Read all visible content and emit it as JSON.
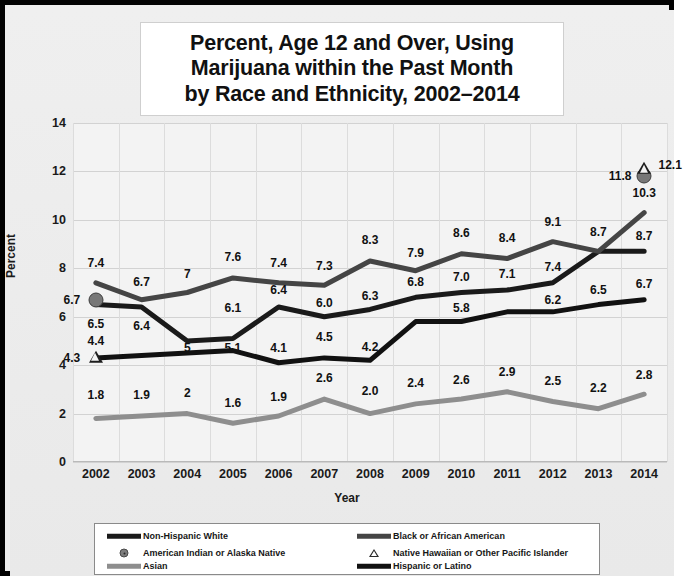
{
  "chart_data": {
    "type": "line",
    "title_lines": [
      "Percent, Age 12 and Over, Using",
      "Marijuana within the Past Month",
      "by Race and Ethnicity, 2002–2014"
    ],
    "xlabel": "Year",
    "ylabel": "Percent",
    "ylim": [
      0,
      14
    ],
    "yticks": [
      0,
      2,
      4,
      6,
      8,
      10,
      12,
      14
    ],
    "ytick_labels": [
      "0",
      "2",
      "4",
      "6",
      "8",
      "10",
      "12",
      "14"
    ],
    "grid": true,
    "legend_position": "bottom",
    "categories": [
      2002,
      2003,
      2004,
      2005,
      2006,
      2007,
      2008,
      2009,
      2010,
      2011,
      2012,
      2013,
      2014
    ],
    "xtick_labels": [
      "2002",
      "2003",
      "2004",
      "2005",
      "2006",
      "2007",
      "2008",
      "2009",
      "2010",
      "2011",
      "2012",
      "2013",
      "2014"
    ],
    "series": [
      {
        "name": "Non-Hispanic White",
        "color": "#1a1a1a",
        "style": "line-thick",
        "values": [
          6.5,
          6.4,
          5.0,
          5.1,
          6.4,
          6.0,
          6.3,
          6.8,
          7.0,
          7.1,
          7.4,
          8.7,
          8.7
        ],
        "labels": [
          "6.5",
          "6.4",
          "5",
          "5.1",
          "6.4",
          "6.0",
          "6.3",
          "6.8",
          "7.0",
          "7.1",
          "7.4",
          "8.7",
          "8.7"
        ]
      },
      {
        "name": "Black or African American",
        "color": "#454545",
        "style": "line-thick",
        "values": [
          7.4,
          6.7,
          7.0,
          7.6,
          7.4,
          7.3,
          8.3,
          7.9,
          8.6,
          8.4,
          9.1,
          8.7,
          10.3
        ],
        "labels": [
          "7.4",
          "6.7",
          "7",
          "7.6",
          "7.4",
          "7.3",
          "8.3",
          "7.9",
          "8.6",
          "8.4",
          "9.1",
          "8.7",
          "10.3"
        ]
      },
      {
        "name": "American Indian or Alaska Native",
        "color": "#777777",
        "style": "marker-circle",
        "values": [
          6.7,
          null,
          null,
          null,
          null,
          null,
          null,
          null,
          null,
          null,
          null,
          null,
          11.8
        ],
        "labels": [
          "6.7",
          "",
          "",
          "",
          "",
          "",
          "",
          "",
          "",
          "",
          "",
          "",
          "11.8"
        ]
      },
      {
        "name": "Native Hawaiian or Other Pacific Islander",
        "color": "#1d1d1d",
        "style": "marker-triangle",
        "values": [
          4.3,
          null,
          null,
          null,
          null,
          null,
          null,
          null,
          null,
          null,
          null,
          null,
          12.1
        ],
        "labels": [
          "4.3",
          "",
          "",
          "",
          "",
          "",
          "",
          "",
          "",
          "",
          "",
          "",
          "12.1"
        ]
      },
      {
        "name": "Asian",
        "color": "#8e8e8e",
        "style": "line-thick",
        "values": [
          1.8,
          1.9,
          2.0,
          1.6,
          1.9,
          2.6,
          2.0,
          2.4,
          2.6,
          2.9,
          2.5,
          2.2,
          2.8
        ],
        "labels": [
          "1.8",
          "1.9",
          "2",
          "1.6",
          "1.9",
          "2.6",
          "2.0",
          "2.4",
          "2.6",
          "2.9",
          "2.5",
          "2.2",
          "2.8"
        ]
      },
      {
        "name": "Hispanic or Latino",
        "color": "#111111",
        "style": "line-thick",
        "values": [
          4.3,
          4.4,
          4.5,
          4.6,
          4.1,
          4.3,
          4.2,
          5.8,
          5.8,
          6.2,
          6.2,
          6.5,
          6.7
        ],
        "labels": [
          "",
          "4.4",
          "",
          "",
          "4.1",
          "4.5",
          "4.2",
          "5.8",
          "",
          "6.2",
          "",
          "6.5",
          "6.7"
        ]
      }
    ],
    "annotations": [
      {
        "text": "7.4",
        "x": 2002,
        "y": 8.2,
        "series": "Black or African American"
      },
      {
        "text": "6.7",
        "x": 2003,
        "y": 7.45,
        "series": "Black or African American"
      },
      {
        "text": "7",
        "x": 2004,
        "y": 7.75,
        "series": "Black or African American"
      },
      {
        "text": "7.6",
        "x": 2005,
        "y": 8.45,
        "series": "Black or African American"
      },
      {
        "text": "7.4",
        "x": 2006,
        "y": 8.2,
        "series": "Black or African American"
      },
      {
        "text": "7.3",
        "x": 2007,
        "y": 8.1,
        "series": "Black or African American"
      },
      {
        "text": "8.3",
        "x": 2008,
        "y": 9.15,
        "series": "Black or African American"
      },
      {
        "text": "7.9",
        "x": 2009,
        "y": 8.65,
        "series": "Black or African American"
      },
      {
        "text": "8.6",
        "x": 2010,
        "y": 9.45,
        "series": "Black or African American"
      },
      {
        "text": "8.4",
        "x": 2011,
        "y": 9.25,
        "series": "Black or African American"
      },
      {
        "text": "9.1",
        "x": 2012,
        "y": 9.9,
        "series": "Black or African American"
      },
      {
        "text": "8.7",
        "x": 2013,
        "y": 9.5,
        "series": "Black or African American"
      },
      {
        "text": "10.3",
        "x": 2014,
        "y": 11.1,
        "series": "Black or African American"
      },
      {
        "text": "6.5",
        "x": 2002,
        "y": 5.7,
        "series": "Non-Hispanic White"
      },
      {
        "text": "6.4",
        "x": 2003,
        "y": 5.6,
        "series": "Non-Hispanic White"
      },
      {
        "text": "5",
        "x": 2004,
        "y": 4.7,
        "series": "Non-Hispanic White"
      },
      {
        "text": "5.1",
        "x": 2005,
        "y": 4.7,
        "series": "Non-Hispanic White"
      },
      {
        "text": "6.1",
        "x": 2005,
        "y": 6.35,
        "series": "Non-Hispanic White"
      },
      {
        "text": "6.4",
        "x": 2006,
        "y": 7.1,
        "series": "Non-Hispanic White"
      },
      {
        "text": "6.0",
        "x": 2007,
        "y": 6.55,
        "series": "Non-Hispanic White"
      },
      {
        "text": "6.3",
        "x": 2008,
        "y": 6.85,
        "series": "Non-Hispanic White"
      },
      {
        "text": "6.8",
        "x": 2009,
        "y": 7.45,
        "series": "Non-Hispanic White"
      },
      {
        "text": "7.0",
        "x": 2010,
        "y": 7.65,
        "series": "Non-Hispanic White"
      },
      {
        "text": "7.1",
        "x": 2011,
        "y": 7.75,
        "series": "Non-Hispanic White"
      },
      {
        "text": "7.4",
        "x": 2012,
        "y": 8.05,
        "series": "Non-Hispanic White"
      },
      {
        "text": "8.7",
        "x": 2014,
        "y": 9.35,
        "series": "Non-Hispanic White"
      },
      {
        "text": "4.4",
        "x": 2002,
        "y": 5.0,
        "series": "Hispanic or Latino"
      },
      {
        "text": "4.1",
        "x": 2006,
        "y": 4.7,
        "series": "Hispanic or Latino"
      },
      {
        "text": "4.5",
        "x": 2007,
        "y": 5.15,
        "series": "Hispanic or Latino"
      },
      {
        "text": "4.2",
        "x": 2008,
        "y": 4.75,
        "series": "Hispanic or Latino"
      },
      {
        "text": "5.8",
        "x": 2010,
        "y": 6.35,
        "series": "Hispanic or Latino"
      },
      {
        "text": "6.2",
        "x": 2012,
        "y": 6.7,
        "series": "Hispanic or Latino"
      },
      {
        "text": "6.5",
        "x": 2013,
        "y": 7.1,
        "series": "Hispanic or Latino"
      },
      {
        "text": "6.7",
        "x": 2014,
        "y": 7.35,
        "series": "Hispanic or Latino"
      },
      {
        "text": "1.8",
        "x": 2002,
        "y": 2.75,
        "series": "Asian"
      },
      {
        "text": "1.9",
        "x": 2003,
        "y": 2.75,
        "series": "Asian"
      },
      {
        "text": "2",
        "x": 2004,
        "y": 2.85,
        "series": "Asian"
      },
      {
        "text": "1.6",
        "x": 2005,
        "y": 2.45,
        "series": "Asian"
      },
      {
        "text": "1.9",
        "x": 2006,
        "y": 2.7,
        "series": "Asian"
      },
      {
        "text": "2.6",
        "x": 2007,
        "y": 3.45,
        "series": "Asian"
      },
      {
        "text": "2.0",
        "x": 2008,
        "y": 2.95,
        "series": "Asian"
      },
      {
        "text": "2.4",
        "x": 2009,
        "y": 3.25,
        "series": "Asian"
      },
      {
        "text": "2.6",
        "x": 2010,
        "y": 3.4,
        "series": "Asian"
      },
      {
        "text": "2.9",
        "x": 2011,
        "y": 3.7,
        "series": "Asian"
      },
      {
        "text": "2.5",
        "x": 2012,
        "y": 3.35,
        "series": "Asian"
      },
      {
        "text": "2.2",
        "x": 2013,
        "y": 3.05,
        "series": "Asian"
      },
      {
        "text": "2.8",
        "x": 2014,
        "y": 3.6,
        "series": "Asian"
      },
      {
        "text": "6.7",
        "x": 2002,
        "y": 6.7,
        "series": "American Indian or Alaska Native",
        "side": "left"
      },
      {
        "text": "11.8",
        "x": 2014,
        "y": 11.8,
        "series": "American Indian or Alaska Native",
        "side": "left"
      },
      {
        "text": "4.3",
        "x": 2002,
        "y": 4.3,
        "series": "Native Hawaiian or Other Pacific Islander",
        "side": "left"
      },
      {
        "text": "12.1",
        "x": 2014,
        "y": 12.25,
        "series": "Native Hawaiian or Other Pacific Islander",
        "side": "right"
      }
    ],
    "legend": [
      {
        "label": "Non-Hispanic White",
        "marker": "line",
        "color": "#1a1a1a"
      },
      {
        "label": "Black or African American",
        "marker": "line",
        "color": "#454545"
      },
      {
        "label": "American Indian or Alaska Native",
        "marker": "circle",
        "color": "#7d7d7d"
      },
      {
        "label": "Native Hawaiian or Other Pacific Islander",
        "marker": "triangle",
        "color": "#2a2a2a"
      },
      {
        "label": "Asian",
        "marker": "line",
        "color": "#8e8e8e"
      },
      {
        "label": "Hispanic or Latino",
        "marker": "line",
        "color": "#111111"
      }
    ]
  }
}
